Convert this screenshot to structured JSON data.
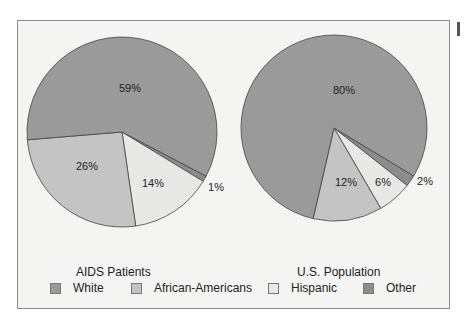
{
  "chart_data": [
    {
      "type": "pie",
      "title": "AIDS Patients",
      "categories": [
        "White",
        "African-Americans",
        "Hispanic",
        "Other"
      ],
      "values": [
        59,
        26,
        14,
        1
      ],
      "labels": [
        "59%",
        "26%",
        "14%",
        "1%"
      ]
    },
    {
      "type": "pie",
      "title": "U.S. Population",
      "categories": [
        "White",
        "African-Americans",
        "Hispanic",
        "Other"
      ],
      "values": [
        80,
        12,
        6,
        2
      ],
      "labels": [
        "80%",
        "12%",
        "6%",
        "2%"
      ]
    }
  ],
  "legend": {
    "position": "bottom",
    "items": [
      {
        "label": "White",
        "color": "#9a9a9a"
      },
      {
        "label": "African-Americans",
        "color": "#c4c4c4"
      },
      {
        "label": "Hispanic",
        "color": "#e8e8e6"
      },
      {
        "label": "Other",
        "color": "#8c8c8c"
      }
    ]
  },
  "pies": {
    "left": {
      "title": "AIDS Patients"
    },
    "right": {
      "title": "U.S. Population"
    }
  }
}
